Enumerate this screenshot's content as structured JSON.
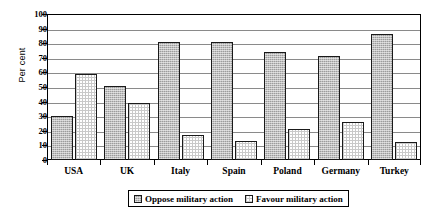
{
  "chart_data": {
    "type": "bar",
    "title": "",
    "xlabel": "",
    "ylabel": "Per cent",
    "ylim": [
      0,
      100
    ],
    "ytick_step": 10,
    "yticks": [
      100,
      90,
      80,
      70,
      60,
      50,
      40,
      30,
      20,
      10,
      0
    ],
    "grid": true,
    "legend_position": "bottom",
    "categories": [
      "USA",
      "UK",
      "Italy",
      "Spain",
      "Poland",
      "Germany",
      "Turkey"
    ],
    "series": [
      {
        "name": "Oppose military action",
        "pattern": "dark-stipple",
        "color": "#9c9c9c",
        "values": [
          30,
          51,
          81,
          81,
          74,
          71,
          86
        ]
      },
      {
        "name": "Favour military action",
        "pattern": "light-checker",
        "color": "#ffffff",
        "values": [
          59,
          39,
          17,
          13,
          21,
          26,
          12
        ]
      }
    ]
  },
  "axis": {
    "y_title": "Per cent"
  },
  "legend": {
    "items": [
      {
        "label": "Oppose military action"
      },
      {
        "label": "Favour military action"
      }
    ]
  }
}
